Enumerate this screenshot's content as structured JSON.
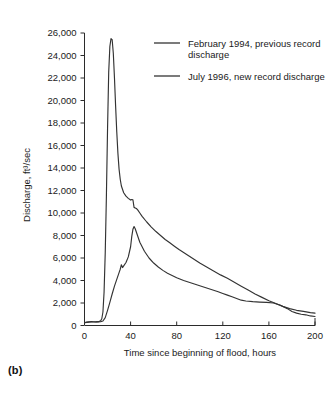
{
  "figure": {
    "panel_label": "(b)",
    "background_color": "#ffffff",
    "line_color": "#333333"
  },
  "chart_data": {
    "type": "line",
    "title": "",
    "xlabel": "Time since beginning of flood, hours",
    "ylabel": "Discharge, ft3/sec",
    "ylabel_display": "Discharge, ft³/sec",
    "xlim": [
      0,
      200
    ],
    "ylim": [
      0,
      26000
    ],
    "grid": false,
    "legend_position": "top-right-inside",
    "xticks": [
      0,
      40,
      80,
      120,
      160,
      200
    ],
    "xtick_labels": [
      "0",
      "40",
      "80",
      "120",
      "160",
      "200"
    ],
    "yticks": [
      0,
      2000,
      4000,
      6000,
      8000,
      10000,
      12000,
      14000,
      16000,
      18000,
      20000,
      22000,
      24000,
      26000
    ],
    "ytick_labels": [
      "0",
      "2,000",
      "4,000",
      "6,000",
      "8,000",
      "10,000",
      "12,000",
      "14,000",
      "16,000",
      "18,000",
      "20,000",
      "22,000",
      "24,000",
      "26,000"
    ],
    "series": [
      {
        "name": "February 1994, previous record discharge",
        "color": "#333333",
        "x": [
          0,
          2,
          4,
          6,
          8,
          10,
          12,
          14,
          16,
          18,
          20,
          22,
          24,
          26,
          28,
          30,
          31,
          32,
          33,
          34,
          36,
          38,
          40,
          41,
          42,
          43,
          44,
          46,
          48,
          52,
          56,
          60,
          64,
          68,
          72,
          76,
          80,
          86,
          92,
          98,
          104,
          110,
          116,
          120,
          124,
          128,
          132,
          136,
          140,
          146,
          152,
          158,
          164,
          170,
          176,
          180,
          184,
          188,
          192,
          196,
          200
        ],
        "y": [
          250,
          300,
          330,
          340,
          330,
          320,
          320,
          330,
          400,
          700,
          1350,
          2050,
          2800,
          3500,
          4100,
          4700,
          5000,
          5400,
          5150,
          5300,
          5600,
          6100,
          7000,
          7900,
          8550,
          8800,
          8600,
          8000,
          7400,
          6600,
          6000,
          5550,
          5200,
          4900,
          4650,
          4450,
          4250,
          4000,
          3800,
          3600,
          3400,
          3200,
          3000,
          2850,
          2700,
          2550,
          2400,
          2250,
          2180,
          2120,
          2080,
          2050,
          2000,
          1800,
          1500,
          1250,
          1100,
          1000,
          950,
          850,
          800
        ]
      },
      {
        "name": "July 1996, new record discharge",
        "color": "#333333",
        "x": [
          0,
          2,
          4,
          6,
          8,
          10,
          12,
          14,
          15,
          16,
          17,
          18,
          19,
          20,
          21,
          22,
          23,
          24,
          25,
          26,
          27,
          28,
          29,
          30,
          31,
          32,
          34,
          36,
          38,
          40,
          41,
          42,
          43,
          44,
          45,
          46,
          48,
          50,
          54,
          58,
          62,
          66,
          70,
          74,
          78,
          82,
          88,
          94,
          100,
          106,
          112,
          118,
          124,
          130,
          136,
          142,
          148,
          154,
          160,
          166,
          172,
          178,
          184,
          190,
          196,
          200
        ],
        "y": [
          250,
          280,
          300,
          310,
          310,
          320,
          340,
          420,
          600,
          1200,
          3000,
          6500,
          11500,
          17500,
          22500,
          24800,
          25500,
          25400,
          24200,
          22000,
          19500,
          17200,
          15300,
          13900,
          13000,
          12400,
          11800,
          11500,
          11300,
          11150,
          11200,
          11180,
          10500,
          10450,
          10400,
          10300,
          10000,
          9700,
          9200,
          8750,
          8350,
          8000,
          7650,
          7350,
          7050,
          6750,
          6350,
          5950,
          5550,
          5200,
          4850,
          4500,
          4200,
          3850,
          3500,
          3150,
          2800,
          2500,
          2200,
          1950,
          1700,
          1500,
          1350,
          1250,
          1150,
          1100
        ]
      }
    ],
    "legend": [
      {
        "label_line1": "February 1994, previous record",
        "label_line2": "discharge",
        "color": "#333333"
      },
      {
        "label_line1": "July 1996, new record discharge",
        "label_line2": "",
        "color": "#333333"
      }
    ]
  }
}
